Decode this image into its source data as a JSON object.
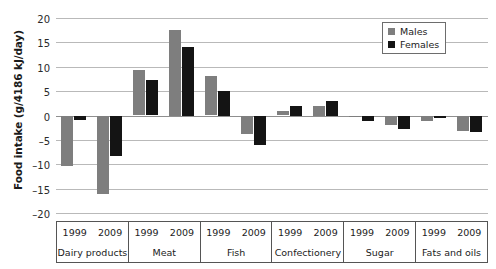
{
  "chart_data": {
    "type": "bar",
    "title": "",
    "xlabel": "",
    "ylabel": "Food intake (g/4186 kJ/day)",
    "ylim": [
      -20,
      20
    ],
    "yticks": [
      20,
      15,
      10,
      5,
      0,
      -5,
      -10,
      -15,
      -20
    ],
    "ytick_labels": [
      "20",
      "15",
      "10",
      "5",
      "0",
      "–5",
      "–10",
      "–15",
      "–20"
    ],
    "grid": true,
    "legend_position": "top-right",
    "legend": [
      "Males",
      "Females"
    ],
    "colors": {
      "males": "#7e7e7e",
      "females": "#141414",
      "gridline": "#b9b9b9",
      "axis": "#555555"
    },
    "group_labels": [
      "Dairy products",
      "Meat",
      "Fish",
      "Confectionery",
      "Sugar",
      "Fats and oils"
    ],
    "year_labels": [
      "1999",
      "2009"
    ],
    "categories": [
      "Dairy products 1999",
      "Dairy products 2009",
      "Meat 1999",
      "Meat 2009",
      "Fish 1999",
      "Fish 2009",
      "Confectionery 1999",
      "Confectionery 2009",
      "Sugar 1999",
      "Sugar 2009",
      "Fats and oils 1999",
      "Fats and oils 2009"
    ],
    "series": [
      {
        "name": "Males",
        "values": [
          -10.3,
          -16.0,
          9.4,
          17.5,
          8.1,
          -3.7,
          0.9,
          2.0,
          -0.4,
          -1.9,
          -1.1,
          -3.2
        ]
      },
      {
        "name": "Females",
        "values": [
          -1.0,
          -8.4,
          7.3,
          14.0,
          5.0,
          -6.0,
          2.0,
          3.0,
          -1.2,
          -2.8,
          -0.6,
          -3.3
        ]
      }
    ],
    "groups": [
      {
        "label": "Dairy products",
        "years": [
          {
            "year": "1999",
            "males": -10.3,
            "females": -1.0
          },
          {
            "year": "2009",
            "males": -16.0,
            "females": -8.4
          }
        ]
      },
      {
        "label": "Meat",
        "years": [
          {
            "year": "1999",
            "males": 9.4,
            "females": 7.3
          },
          {
            "year": "2009",
            "males": 17.5,
            "females": 14.0
          }
        ]
      },
      {
        "label": "Fish",
        "years": [
          {
            "year": "1999",
            "males": 8.1,
            "females": 5.0
          },
          {
            "year": "2009",
            "males": -3.7,
            "females": -6.0
          }
        ]
      },
      {
        "label": "Confectionery",
        "years": [
          {
            "year": "1999",
            "males": 0.9,
            "females": 2.0
          },
          {
            "year": "2009",
            "males": 2.0,
            "females": 3.0
          }
        ]
      },
      {
        "label": "Sugar",
        "years": [
          {
            "year": "1999",
            "males": -0.4,
            "females": -1.2
          },
          {
            "year": "2009",
            "males": -1.9,
            "females": -2.8
          }
        ]
      },
      {
        "label": "Fats and oils",
        "years": [
          {
            "year": "1999",
            "males": -1.1,
            "females": -0.6
          },
          {
            "year": "2009",
            "males": -3.2,
            "females": -3.3
          }
        ]
      }
    ]
  }
}
